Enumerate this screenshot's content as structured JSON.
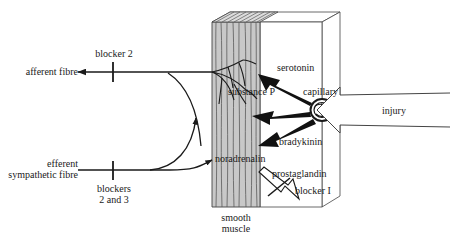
{
  "diagram": {
    "type": "biomedical-schematic",
    "colors": {
      "muscle_fill": "#c8c8c8",
      "muscle_stroke": "#555555",
      "line": "#1a1a1a",
      "arrow_solid": "#111111",
      "arrow_hollow_fill": "#ffffff",
      "background": "#ffffff"
    }
  },
  "labels": {
    "afferent_fibre": "afferent fibre",
    "blocker_2": "blocker 2",
    "efferent_sympathetic_fibre_l1": "efferent",
    "efferent_sympathetic_fibre_l2": "sympathetic fibre",
    "blockers_2_and_3_l1": "blockers",
    "blockers_2_and_3_l2": "2 and 3",
    "serotonin": "serotonin",
    "substance_p": "substance P",
    "capillary": "capillary",
    "bradykinin": "bradykinin",
    "noradrenalin": "noradrenalin",
    "prostaglandin": "prostaglandin",
    "blocker_1": "blocker I",
    "injury": "injury",
    "smooth_muscle_l1": "smooth",
    "smooth_muscle_l2": "muscle"
  },
  "structures": {
    "muscle_block": "smooth-muscle-slab",
    "tissue_box": "3d-tissue-box",
    "capillary_vessel": "capillary-cross-section",
    "injury_arrow": "injury-block-arrow"
  },
  "mediators": [
    {
      "name": "serotonin",
      "arrow": "solid-black",
      "direction": "capillary-to-nerve-ending"
    },
    {
      "name": "substance P",
      "arrow": "solid-black",
      "direction": "capillary-to-nerve-ending"
    },
    {
      "name": "bradykinin",
      "arrow": "solid-black",
      "direction": "capillary-to-nerve-ending"
    },
    {
      "name": "prostaglandin",
      "arrow": "hollow-white",
      "direction": "tissue-to-nerve-ending"
    },
    {
      "name": "noradrenalin",
      "arrow": "thin-curve",
      "direction": "efferent-fibre-to-muscle"
    }
  ],
  "blockers": [
    {
      "label": "blocker 2",
      "on": "afferent fibre"
    },
    {
      "label": "blockers 2 and 3",
      "on": "efferent sympathetic fibre"
    },
    {
      "label": "blocker I",
      "on": "prostaglandin"
    }
  ]
}
